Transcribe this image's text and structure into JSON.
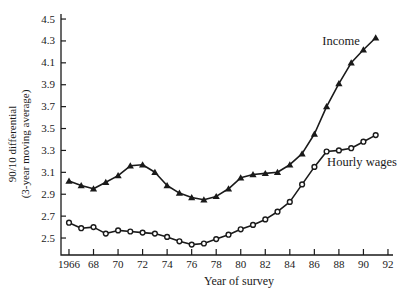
{
  "chart_data": {
    "type": "line",
    "title": "",
    "xlabel": "Year of survey",
    "ylabel_line1": "90/10 differential",
    "ylabel_line2": "(3-year moving average)",
    "grid": false,
    "background": "#ffffff",
    "line_color": "#1a1a1a",
    "legend_position": "inline-annotations",
    "x": [
      1966,
      1967,
      1968,
      1969,
      1970,
      1971,
      1972,
      1973,
      1974,
      1975,
      1976,
      1977,
      1978,
      1979,
      1980,
      1981,
      1982,
      1983,
      1984,
      1985,
      1986,
      1987,
      1988,
      1989,
      1990,
      1991
    ],
    "series": [
      {
        "name": "Income",
        "marker": "triangle-filled",
        "values": [
          3.02,
          2.98,
          2.95,
          3.01,
          3.07,
          3.16,
          3.17,
          3.1,
          2.98,
          2.91,
          2.87,
          2.85,
          2.88,
          2.95,
          3.05,
          3.08,
          3.09,
          3.1,
          3.17,
          3.27,
          3.45,
          3.7,
          3.91,
          4.1,
          4.22,
          4.33
        ]
      },
      {
        "name": "Hourly wages",
        "marker": "circle-open",
        "values": [
          2.64,
          2.59,
          2.6,
          2.54,
          2.57,
          2.56,
          2.55,
          2.54,
          2.51,
          2.47,
          2.44,
          2.45,
          2.49,
          2.53,
          2.58,
          2.62,
          2.67,
          2.74,
          2.83,
          2.99,
          3.15,
          3.29,
          3.3,
          3.32,
          3.38,
          3.44
        ]
      }
    ],
    "xlim": [
      1965.35,
      1992.41
    ],
    "ylim": [
      2.345,
      4.546
    ],
    "x_ticks": {
      "values": [
        1966,
        1968,
        1970,
        1972,
        1974,
        1976,
        1978,
        1980,
        1982,
        1984,
        1986,
        1988,
        1990,
        1992
      ],
      "labels": [
        "1966",
        "68",
        "70",
        "72",
        "74",
        "76",
        "78",
        "80",
        "82",
        "84",
        "86",
        "88",
        "90",
        "92"
      ]
    },
    "y_ticks": {
      "values": [
        2.5,
        2.7,
        2.9,
        3.1,
        3.3,
        3.5,
        3.7,
        3.9,
        4.1,
        4.3,
        4.5
      ],
      "labels": [
        "2.5",
        "2.7",
        "2.9",
        "3.1",
        "3.3",
        "3.5",
        "3.7",
        "3.9",
        "4.1",
        "4.3",
        "4.5"
      ]
    }
  }
}
